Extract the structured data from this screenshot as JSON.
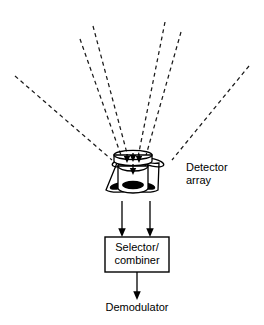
{
  "diagram": {
    "background_color": "#ffffff",
    "stroke_color": "#000000",
    "labels": {
      "detector_array_line1": "Detector",
      "detector_array_line2": "array",
      "selector_combiner_line1": "Selector/",
      "selector_combiner_line2": "combiner",
      "demodulator": "Demodulator"
    },
    "incoming_rays": {
      "count": 6,
      "style": "dashed",
      "description": "Six dashed multipath signal rays arriving from above onto the detector array",
      "segments": [
        {
          "name": "ray-far-left",
          "x1": 15,
          "y1": 76,
          "x2": 112,
          "y2": 160
        },
        {
          "name": "ray-left-outer",
          "x1": 80,
          "y1": 39,
          "x2": 122,
          "y2": 158
        },
        {
          "name": "ray-left-inner",
          "x1": 93,
          "y1": 26,
          "x2": 128,
          "y2": 157
        },
        {
          "name": "ray-right-inner",
          "x1": 165,
          "y1": 22,
          "x2": 138,
          "y2": 157
        },
        {
          "name": "ray-right-outer",
          "x1": 181,
          "y1": 32,
          "x2": 145,
          "y2": 159
        },
        {
          "name": "ray-far-right",
          "x1": 249,
          "y1": 66,
          "x2": 172,
          "y2": 160
        }
      ]
    },
    "detector_array": {
      "element_count": 3,
      "description": "Three tilted cylindrical detector elements, each with a dark elliptical sensor face",
      "center_element": {
        "cx": 132,
        "cy": 178
      },
      "left_element": {
        "cx": 110,
        "cy": 180
      },
      "right_element": {
        "cx": 154,
        "cy": 180
      }
    },
    "output_arrows": {
      "count": 2,
      "from_y": 200,
      "to_y": 236,
      "x_positions": [
        122,
        150
      ]
    },
    "selector_box": {
      "x": 105,
      "y": 237,
      "width": 64,
      "height": 35
    },
    "final_arrow": {
      "x": 137,
      "from_y": 272,
      "to_y": 299
    }
  }
}
